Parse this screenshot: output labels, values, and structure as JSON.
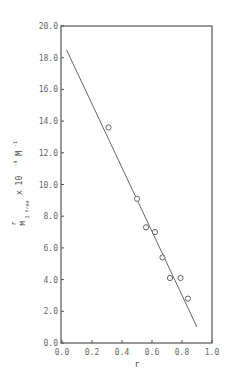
{
  "chart_data": {
    "type": "scatter",
    "title": "",
    "xlabel": "r",
    "ylabel": "r / M2 free × 10^-4 M^-1",
    "ylabel_parts": {
      "numerator": "r",
      "denominator": "M",
      "sub": "2 free",
      "mult": "x 10",
      "exp": "-4",
      "unit": "M",
      "unit_exp": "-1"
    },
    "xlim": [
      0.0,
      1.0
    ],
    "ylim": [
      0.0,
      20.0
    ],
    "x_ticks": [
      "0.0",
      "0.2",
      "0.4",
      "0.6",
      "0.8",
      "1.0"
    ],
    "y_ticks": [
      "0.0",
      "2.0",
      "4.0",
      "6.0",
      "8.0",
      "10.0",
      "12.0",
      "14.0",
      "16.0",
      "18.0",
      "20.0"
    ],
    "grid": false,
    "legend": null,
    "series": [
      {
        "name": "data",
        "marker": "open-circle",
        "x": [
          0.31,
          0.5,
          0.56,
          0.62,
          0.67,
          0.72,
          0.79,
          0.84
        ],
        "y": [
          13.6,
          9.1,
          7.3,
          7.0,
          5.4,
          4.1,
          4.1,
          2.8
        ]
      },
      {
        "name": "fit",
        "style": "line",
        "x": [
          0.03,
          0.9
        ],
        "y": [
          18.5,
          1.0
        ]
      }
    ]
  }
}
